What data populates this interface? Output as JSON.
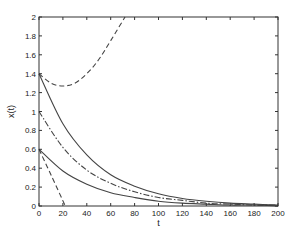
{
  "chart_data": {
    "type": "line",
    "title": "",
    "xlabel": "t",
    "ylabel": "x(t)",
    "xlim": [
      0,
      200
    ],
    "ylim": [
      0,
      2
    ],
    "grid": false,
    "legend": null,
    "xticks": [
      "0",
      "20",
      "40",
      "60",
      "80",
      "100",
      "120",
      "140",
      "160",
      "180",
      "200"
    ],
    "yticks": [
      "0",
      "0.2",
      "0.4",
      "0.6",
      "0.8",
      "1",
      "1.2",
      "1.4",
      "1.6",
      "1.8",
      "2"
    ],
    "series": [
      {
        "name": "solid-upper",
        "style": "solid",
        "x": [
          0,
          20,
          40,
          60,
          80,
          100,
          120,
          140,
          160,
          180,
          200
        ],
        "values": [
          1.4,
          0.87,
          0.54,
          0.33,
          0.21,
          0.13,
          0.08,
          0.05,
          0.03,
          0.02,
          0.01
        ]
      },
      {
        "name": "dashdot-middle",
        "style": "dashdot",
        "x": [
          0,
          20,
          40,
          60,
          80,
          100,
          120,
          140,
          160,
          180,
          200
        ],
        "values": [
          1.0,
          0.62,
          0.38,
          0.24,
          0.15,
          0.09,
          0.06,
          0.03,
          0.02,
          0.01,
          0.01
        ]
      },
      {
        "name": "solid-lower",
        "style": "solid",
        "x": [
          0,
          20,
          40,
          60,
          80,
          100,
          120,
          140,
          160,
          180,
          200
        ],
        "values": [
          0.6,
          0.37,
          0.23,
          0.14,
          0.09,
          0.05,
          0.03,
          0.02,
          0.01,
          0.01,
          0.0
        ]
      },
      {
        "name": "dashed-upper",
        "style": "dashed",
        "x": [
          0,
          10,
          20,
          30,
          40,
          50,
          60,
          72
        ],
        "values": [
          1.4,
          1.3,
          1.27,
          1.3,
          1.4,
          1.55,
          1.75,
          2.0
        ]
      },
      {
        "name": "dashed-lower",
        "style": "dashed",
        "x": [
          0,
          10,
          22
        ],
        "values": [
          0.6,
          0.33,
          0.0
        ]
      }
    ]
  }
}
